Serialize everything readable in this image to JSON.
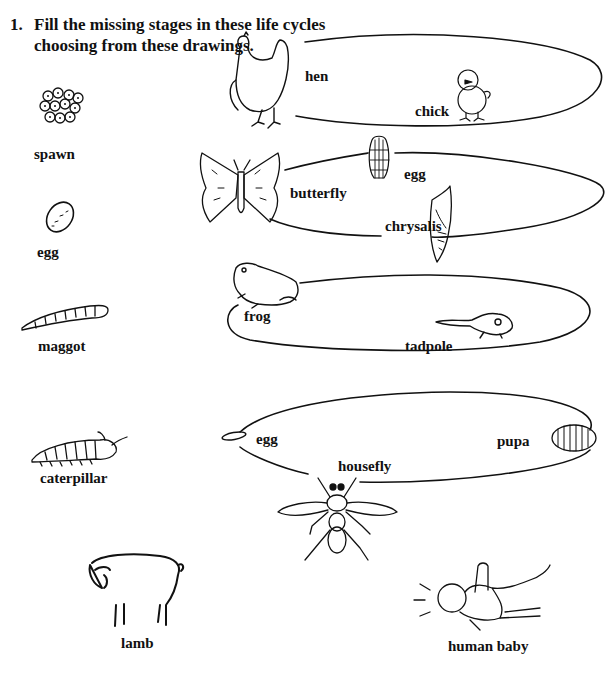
{
  "question": {
    "number": "1.",
    "line1": "Fill the missing stages in these life cycles",
    "line2": "choosing from these drawings."
  },
  "choices": [
    {
      "id": "spawn",
      "label": "spawn",
      "icon": "frogspawn-icon"
    },
    {
      "id": "egg",
      "label": "egg",
      "icon": "egg-icon"
    },
    {
      "id": "maggot",
      "label": "maggot",
      "icon": "maggot-icon"
    },
    {
      "id": "caterpillar",
      "label": "caterpillar",
      "icon": "caterpillar-icon"
    },
    {
      "id": "lamb",
      "label": "lamb",
      "icon": "lamb-icon"
    },
    {
      "id": "human_baby",
      "label": "human baby",
      "icon": "human-baby-icon"
    }
  ],
  "cycles": [
    {
      "name": "chicken",
      "stages": [
        {
          "label": "hen",
          "icon": "hen-icon"
        },
        {
          "label": "chick",
          "icon": "chick-icon"
        }
      ]
    },
    {
      "name": "butterfly",
      "stages": [
        {
          "label": "butterfly",
          "icon": "butterfly-icon"
        },
        {
          "label": "egg",
          "icon": "butterfly-egg-icon"
        },
        {
          "label": "chrysalis",
          "icon": "chrysalis-icon"
        }
      ]
    },
    {
      "name": "frog",
      "stages": [
        {
          "label": "frog",
          "icon": "frog-icon"
        },
        {
          "label": "tadpole",
          "icon": "tadpole-icon"
        }
      ]
    },
    {
      "name": "housefly",
      "stages": [
        {
          "label": "egg",
          "icon": "fly-egg-icon"
        },
        {
          "label": "pupa",
          "icon": "pupa-icon"
        },
        {
          "label": "housefly",
          "icon": "housefly-icon"
        }
      ]
    }
  ]
}
